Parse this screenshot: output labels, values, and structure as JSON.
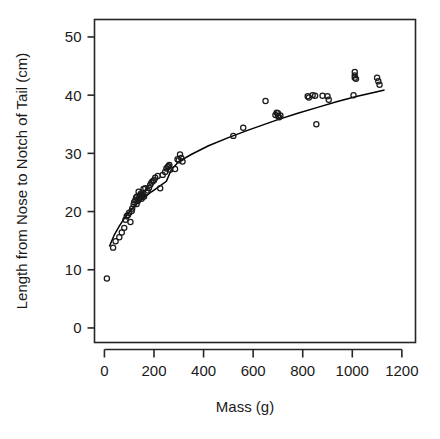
{
  "chart_data": {
    "type": "scatter",
    "title": "",
    "xlabel": "Mass (g)",
    "ylabel": "Length from Nose to Notch of Tail (cm)",
    "xlim": [
      -40,
      1255
    ],
    "ylim": [
      -2.5,
      53
    ],
    "xticks": [
      0,
      200,
      400,
      600,
      800,
      1000,
      1200
    ],
    "xticklabels": [
      "0",
      "200",
      "400",
      "600",
      "800",
      "1000",
      "1200"
    ],
    "yticks": [
      0,
      10,
      20,
      30,
      40,
      50
    ],
    "yticklabels": [
      "0",
      "10",
      "20",
      "30",
      "40",
      "50"
    ],
    "grid": false,
    "legend": null,
    "marker": "open-circle",
    "marker_color": "#1a1a1a",
    "line_color": "#000000",
    "x": [
      10,
      35,
      45,
      60,
      70,
      80,
      85,
      90,
      95,
      100,
      105,
      110,
      112,
      118,
      120,
      125,
      128,
      130,
      132,
      135,
      138,
      140,
      142,
      145,
      148,
      150,
      152,
      155,
      158,
      160,
      165,
      170,
      175,
      180,
      185,
      190,
      195,
      200,
      205,
      215,
      225,
      235,
      245,
      250,
      255,
      258,
      262,
      265,
      285,
      295,
      300,
      305,
      310,
      315,
      520,
      560,
      650,
      690,
      695,
      700,
      700,
      705,
      710,
      820,
      825,
      840,
      850,
      855,
      880,
      900,
      905,
      1005,
      1010,
      1010,
      1010,
      1015,
      1100,
      1105,
      1110
    ],
    "y": [
      8.5,
      13.8,
      14.9,
      15.6,
      16.4,
      17.2,
      18.6,
      19.2,
      19.4,
      19.8,
      18.2,
      20.1,
      20.5,
      21.2,
      21.6,
      22.0,
      22.4,
      21.3,
      22.6,
      21.8,
      23.4,
      22.3,
      22.7,
      22.9,
      23.1,
      22.2,
      22.5,
      22.8,
      23.9,
      22.6,
      24.0,
      23.3,
      23.6,
      24.1,
      24.6,
      25.0,
      25.2,
      25.4,
      25.8,
      26.1,
      24.0,
      26.3,
      26.8,
      27.4,
      27.6,
      27.8,
      28.0,
      27.2,
      27.3,
      29.0,
      28.8,
      29.8,
      29.2,
      28.6,
      33.0,
      34.4,
      39.0,
      36.6,
      37.0,
      36.4,
      36.9,
      36.2,
      36.5,
      39.8,
      39.6,
      40.0,
      39.9,
      35.0,
      39.9,
      39.8,
      39.2,
      40.0,
      44.0,
      43.4,
      43.0,
      42.8,
      43.0,
      42.4,
      41.8
    ],
    "fit_line": {
      "description": "log-style fitted curve",
      "points": [
        [
          20,
          14.0
        ],
        [
          40,
          16.0
        ],
        [
          60,
          17.5
        ],
        [
          80,
          18.8
        ],
        [
          100,
          19.9
        ],
        [
          130,
          21.3
        ],
        [
          160,
          22.4
        ],
        [
          190,
          23.4
        ],
        [
          220,
          24.3
        ],
        [
          250,
          25.2
        ],
        [
          270,
          27.2
        ],
        [
          300,
          28.6
        ],
        [
          350,
          29.8
        ],
        [
          420,
          31.3
        ],
        [
          500,
          32.7
        ],
        [
          580,
          34.0
        ],
        [
          660,
          35.2
        ],
        [
          700,
          35.8
        ],
        [
          780,
          36.9
        ],
        [
          860,
          37.9
        ],
        [
          940,
          38.9
        ],
        [
          1020,
          39.8
        ],
        [
          1100,
          40.6
        ],
        [
          1130,
          40.9
        ]
      ]
    },
    "n_points": 79
  },
  "figure": {
    "background": "#ffffff",
    "frame_color": "#262626",
    "frame_visible": true
  }
}
